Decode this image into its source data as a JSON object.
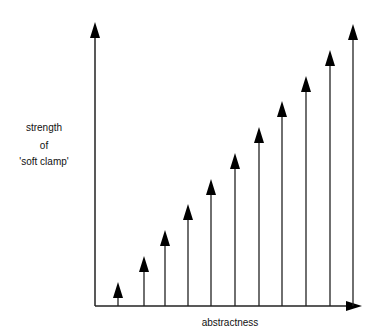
{
  "diagram": {
    "y_label_lines": [
      "strength",
      "of",
      "'soft clamp'"
    ],
    "x_label": "abstractness",
    "line_color": "#222222",
    "background": "#ffffff"
  },
  "chart_data": {
    "type": "bar",
    "title": "",
    "xlabel": "abstractness",
    "ylabel": "strength of 'soft clamp'",
    "categories": [
      1,
      2,
      3,
      4,
      5,
      6,
      7,
      8,
      9,
      10,
      11
    ],
    "values": [
      24,
      50,
      76,
      102,
      127,
      153,
      179,
      205,
      230,
      256,
      282
    ],
    "units": "relative arrow height (px)",
    "grid": false,
    "legend": null
  },
  "layout": {
    "origin": [
      95,
      306
    ],
    "y_axis_tip": 22,
    "x_axis_tip": 362,
    "arrow_x": [
      118,
      144,
      165,
      188,
      211,
      235,
      259,
      282,
      306,
      330,
      353
    ],
    "arrow_tip_y": [
      282,
      256,
      230,
      204,
      179,
      153,
      127,
      101,
      76,
      50,
      24
    ]
  }
}
